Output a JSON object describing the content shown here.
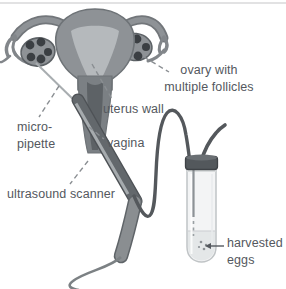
{
  "diagram": {
    "labels": {
      "ovary": {
        "lines": [
          "ovary with",
          "multiple follicles"
        ]
      },
      "uterus_wall": {
        "text": "uterus wall"
      },
      "micro_pipette": {
        "lines": [
          "micro-",
          "pipette"
        ]
      },
      "vagina": {
        "text": "vagina"
      },
      "ultrasound_scanner": {
        "text": "ultrasound scanner"
      },
      "harvested_eggs": {
        "lines": [
          "harvested",
          "eggs"
        ]
      }
    },
    "colors": {
      "background": "#ffffff",
      "top_rule": "#d8d9da",
      "organ_fill": "#8e9296",
      "organ_outline": "#6e7377",
      "uterine_cavity": "#b5b9bc",
      "cervix_fill": "#7b8084",
      "vaginal_canal": "#5d6266",
      "follicle": "#3b3f43",
      "probe_shaft": "#63686c",
      "probe_stripe": "#a6abae",
      "probe_handle": "#8a8e91",
      "tubing": "#54585c",
      "test_tube_fill": "#f3f4f5",
      "test_tube_outline": "#c0c4c6",
      "liquid": "#e4e7e8",
      "cap": "#53585c",
      "label_text": "#54585e",
      "leader_line": "#8a8e92"
    }
  }
}
